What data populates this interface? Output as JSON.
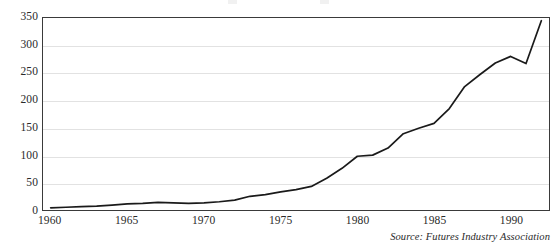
{
  "figure": {
    "name": "futures-contracts-traded-line-chart",
    "source_note": "Source: Futures Industry Association",
    "axis_color": "#3a3a3a",
    "grid_color": "#e2e2e2",
    "line_color": "#1a1a1a"
  },
  "chart_data": {
    "type": "line",
    "title": "",
    "xlabel": "",
    "ylabel": "",
    "xlim": [
      1959.5,
      1992.5
    ],
    "ylim": [
      0,
      350
    ],
    "yticks": [
      0,
      50,
      100,
      150,
      200,
      250,
      300,
      350
    ],
    "xticks": [
      1960,
      1965,
      1970,
      1975,
      1980,
      1985,
      1990
    ],
    "xtick_labels": [
      "1960",
      "1965",
      "1970",
      "1975",
      "1980",
      "1985",
      "1990"
    ],
    "ytick_labels": [
      "0",
      "50",
      "100",
      "150",
      "200",
      "250",
      "300",
      "350"
    ],
    "grid": "horizontal",
    "legend": "none",
    "series": [
      {
        "name": "Futures contracts traded (millions)",
        "x": [
          1960,
          1961,
          1962,
          1963,
          1964,
          1965,
          1966,
          1967,
          1968,
          1969,
          1970,
          1971,
          1972,
          1973,
          1974,
          1975,
          1976,
          1977,
          1978,
          1979,
          1980,
          1981,
          1982,
          1983,
          1984,
          1985,
          1986,
          1987,
          1988,
          1989,
          1990,
          1991,
          1992
        ],
        "values": [
          4,
          5,
          6,
          7,
          9,
          11,
          12,
          14,
          13,
          12,
          13,
          15,
          18,
          25,
          28,
          33,
          37,
          43,
          58,
          76,
          98,
          100,
          113,
          139,
          149,
          158,
          185,
          225,
          247,
          268,
          280,
          267,
          345
        ]
      }
    ],
    "annotations": [
      {
        "label": "plateau",
        "x": 1981,
        "y": 100
      },
      {
        "label": "peak-before-dip",
        "x": 1990,
        "y": 280
      },
      {
        "label": "dip",
        "x": 1991,
        "y": 267
      },
      {
        "label": "final",
        "x": 1992,
        "y": 345
      }
    ]
  }
}
